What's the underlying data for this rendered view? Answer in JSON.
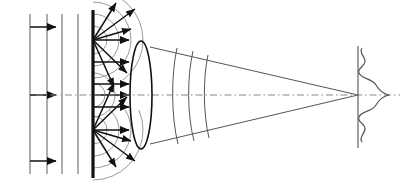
{
  "figure": {
    "width": 405,
    "height": 187,
    "background_color": "#ffffff",
    "stroke_color": "#1a1a1a",
    "thin_stroke_color": "#555555",
    "axis_color": "#777777"
  },
  "optical_axis": {
    "name": "optical-axis",
    "y": 95,
    "x_start": 36,
    "x_end": 400,
    "style": "dash-dot",
    "color": "#888888"
  },
  "incident_plane_waves": {
    "label": "incident plane wavefronts",
    "wavefront_x": [
      30,
      47,
      62,
      78
    ],
    "wavefront_y_top": 14,
    "wavefront_y_bottom": 174,
    "color": "#6b6b6b",
    "arrows": [
      {
        "y": 27,
        "x_start": 30,
        "x_end": 58
      },
      {
        "y": 95,
        "x_start": 30,
        "x_end": 58
      },
      {
        "y": 161,
        "x_start": 30,
        "x_end": 58
      }
    ]
  },
  "aperture_screen": {
    "label": "aperture / slit plane",
    "x": 93,
    "y_top": 10,
    "y_bottom": 178,
    "thickness": 3,
    "color": "#111111"
  },
  "huygens_sources": [
    {
      "name": "upper-source",
      "x": 93,
      "y": 40
    },
    {
      "name": "lower-source",
      "x": 93,
      "y": 130
    }
  ],
  "huygens_wavelets": {
    "label": "secondary spherical wavelets",
    "color": "#8a8a8a",
    "upper_radii": [
      14,
      26,
      38,
      50
    ],
    "lower_radii": [
      14,
      26,
      38,
      50
    ],
    "center_radii": [
      12,
      22
    ]
  },
  "ray_arrows": {
    "label": "diffracted ray directions",
    "color": "#111111",
    "upper_fan": [
      {
        "angle_deg": -58,
        "length": 44
      },
      {
        "angle_deg": -36,
        "length": 52
      },
      {
        "angle_deg": -16,
        "length": 40
      },
      {
        "angle_deg": 44,
        "length": 47
      },
      {
        "angle_deg": 64,
        "length": 52
      }
    ],
    "lower_fan": [
      {
        "angle_deg": -64,
        "length": 52
      },
      {
        "angle_deg": -44,
        "length": 47
      },
      {
        "angle_deg": 16,
        "length": 40
      },
      {
        "angle_deg": 36,
        "length": 52
      },
      {
        "angle_deg": 58,
        "length": 44
      }
    ],
    "forward_arrows": [
      {
        "y": 40,
        "x_start": 93,
        "x_end": 131
      },
      {
        "y": 62,
        "x_start": 93,
        "x_end": 131
      },
      {
        "y": 84,
        "x_start": 93,
        "x_end": 131
      },
      {
        "y": 95,
        "x_start": 93,
        "x_end": 131
      },
      {
        "y": 107,
        "x_start": 93,
        "x_end": 131
      },
      {
        "y": 130,
        "x_start": 93,
        "x_end": 131
      }
    ]
  },
  "lens": {
    "label": "converging lens",
    "center_x": 141,
    "center_y": 95,
    "radius_x": 11,
    "radius_y": 54,
    "color": "#111111"
  },
  "converging_beam": {
    "label": "converging cone to focus",
    "color": "#555555",
    "lens_top_y": 47,
    "lens_bottom_y": 144,
    "lens_edge_x": 150,
    "focus_x": 358,
    "focus_y": 95
  },
  "converging_wavefronts": {
    "label": "curved wavefronts in the converging beam",
    "color": "#555555",
    "fronts": [
      {
        "x_top": 176,
        "x_mid": 171,
        "x_bottom": 177,
        "y_top": 49,
        "y_bottom": 143
      },
      {
        "x_top": 192,
        "x_mid": 187,
        "x_bottom": 193,
        "y_top": 52,
        "y_bottom": 140
      },
      {
        "x_top": 207,
        "x_mid": 203,
        "x_bottom": 208,
        "y_top": 55,
        "y_bottom": 137
      }
    ]
  },
  "focal_plane": {
    "label": "focal / image plane",
    "x": 358,
    "y_top": 46,
    "y_bottom": 148,
    "color": "#555555"
  },
  "diffraction_pattern": {
    "label": "point spread function (sinc / Airy profile)",
    "type": "sinc",
    "color": "#555555",
    "baseline_x": 358,
    "center_y": 95,
    "main_lobe_amplitude": 31,
    "first_side_lobe_amplitude": 8,
    "second_side_lobe_amplitude": 4,
    "half_height": 50
  }
}
